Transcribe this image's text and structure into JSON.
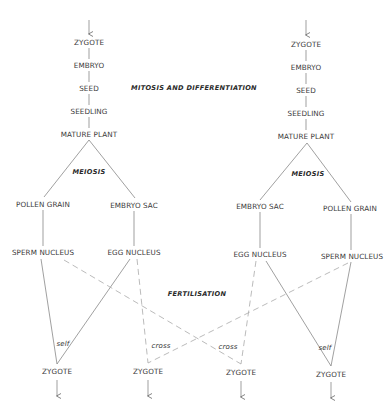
{
  "labels": {
    "mitosis": "MITOSIS AND DIFFERENTIATION",
    "fertilisation": "FERTILISATION",
    "meiosis": "MEIOSIS",
    "self": "self",
    "cross": "cross"
  },
  "left_plant": {
    "stages": [
      "ZYGOTE",
      "EMBRYO",
      "SEED",
      "SEEDLING",
      "MATURE PLANT"
    ],
    "male_gametophyte": "POLLEN GRAIN",
    "female_gametophyte": "EMBRYO SAC",
    "male_gamete": "SPERM NUCLEUS",
    "female_gamete": "EGG NUCLEUS"
  },
  "right_plant": {
    "stages": [
      "ZYGOTE",
      "EMBRYO",
      "SEED",
      "SEEDLING",
      "MATURE PLANT"
    ],
    "female_gametophyte": "EMBRYO SAC",
    "male_gametophyte": "POLLEN GRAIN",
    "female_gamete": "EGG NUCLEUS",
    "male_gamete": "SPERM NUCLEUS"
  },
  "offspring": [
    {
      "label": "ZYGOTE",
      "type": "self"
    },
    {
      "label": "ZYGOTE",
      "type": "cross"
    },
    {
      "label": "ZYGOTE",
      "type": "cross"
    },
    {
      "label": "ZYGOTE",
      "type": "self"
    }
  ],
  "colors": {
    "line": "#777777",
    "dashed": "#aaaaaa",
    "text": "#3a3a3a"
  }
}
